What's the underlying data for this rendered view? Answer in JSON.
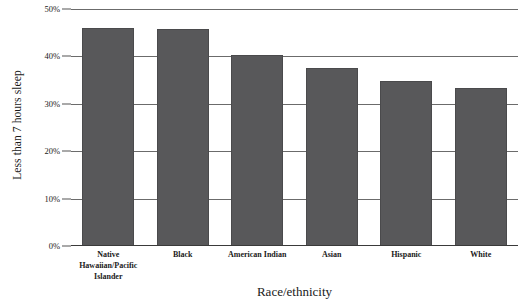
{
  "chart_data": {
    "type": "bar",
    "title": "",
    "xlabel": "Race/ethnicity",
    "ylabel": "Less than 7 hours sleep",
    "categories": [
      "Native Hawaiian/Pacific Islander",
      "Black",
      "American Indian",
      "Asian",
      "Hispanic",
      "White"
    ],
    "values": [
      46.0,
      45.8,
      40.4,
      37.5,
      34.8,
      33.4
    ],
    "value_format": "percent",
    "ylim": [
      0,
      50
    ],
    "yticks": [
      0,
      10,
      20,
      30,
      40,
      50
    ],
    "ytick_labels": [
      "0%",
      "10%",
      "20%",
      "30%",
      "40%",
      "50%"
    ],
    "grid": true,
    "grid_axis": "y",
    "legend": false,
    "bar_color": "#58585a",
    "gridline_color": "#6b6b6b",
    "axis_color": "#3a3a3a",
    "background_color": "#ffffff"
  },
  "axes": {
    "y_title": "Less than 7 hours sleep",
    "x_title": "Race/ethnicity"
  },
  "y_ticks": [
    {
      "label": "50%",
      "value": 50
    },
    {
      "label": "40%",
      "value": 40
    },
    {
      "label": "30%",
      "value": 30
    },
    {
      "label": "20%",
      "value": 20
    },
    {
      "label": "10%",
      "value": 10
    },
    {
      "label": "0%",
      "value": 0
    }
  ],
  "bars": [
    {
      "label": "Native Hawaiian/Pacific Islander",
      "value": 46.0
    },
    {
      "label": "Black",
      "value": 45.8
    },
    {
      "label": "American Indian",
      "value": 40.4
    },
    {
      "label": "Asian",
      "value": 37.5
    },
    {
      "label": "Hispanic",
      "value": 34.8
    },
    {
      "label": "White",
      "value": 33.4
    }
  ]
}
